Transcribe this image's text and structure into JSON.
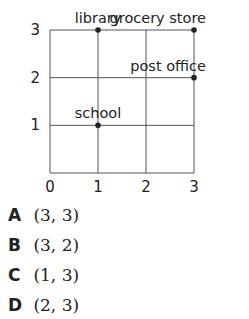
{
  "chart_data": {
    "type": "scatter",
    "title": "",
    "xlabel": "",
    "ylabel": "",
    "xlim": [
      0,
      3
    ],
    "ylim": [
      0,
      3
    ],
    "grid": true,
    "x_ticks": [
      "0",
      "1",
      "2",
      "3"
    ],
    "y_ticks": [
      "1",
      "2",
      "3"
    ],
    "points": [
      {
        "label": "library",
        "x": 1,
        "y": 3
      },
      {
        "label": "grocery store",
        "x": 3,
        "y": 3
      },
      {
        "label": "post office",
        "x": 3,
        "y": 2
      },
      {
        "label": "school",
        "x": 1,
        "y": 1
      }
    ]
  },
  "choices": [
    {
      "letter": "A",
      "value": "(3, 3)"
    },
    {
      "letter": "B",
      "value": "(3, 2)"
    },
    {
      "letter": "C",
      "value": "(1, 3)"
    },
    {
      "letter": "D",
      "value": "(2, 3)"
    }
  ]
}
